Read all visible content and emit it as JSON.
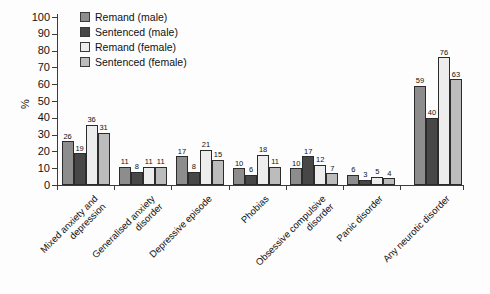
{
  "chart_data": {
    "type": "bar",
    "title": "",
    "xlabel": "",
    "ylabel": "%",
    "ylim": [
      0,
      100
    ],
    "ytick_step": 10,
    "grid": false,
    "legend_position": "top-left",
    "value_labels": true,
    "categories": [
      "Mixed anxiety and\ndepression",
      "Generalised anxiety\ndisorder",
      "Depressive episode",
      "Phobias",
      "Obsessive compulsive\ndisorder",
      "Panic disorder",
      "Any neurotic disorder"
    ],
    "series": [
      {
        "name": "Remand (male)",
        "color": "#8d8d8d",
        "values": [
          26,
          11,
          17,
          10,
          10,
          6,
          59
        ]
      },
      {
        "name": "Sentenced (male)",
        "color": "#474747",
        "values": [
          19,
          8,
          8,
          6,
          17,
          3,
          40
        ]
      },
      {
        "name": "Remand (female)",
        "color": "#ededed",
        "values": [
          36,
          11,
          21,
          18,
          12,
          5,
          76
        ]
      },
      {
        "name": "Sentenced (female)",
        "color": "#bcbcbc",
        "values": [
          31,
          11,
          15,
          11,
          7,
          4,
          63
        ]
      }
    ]
  }
}
